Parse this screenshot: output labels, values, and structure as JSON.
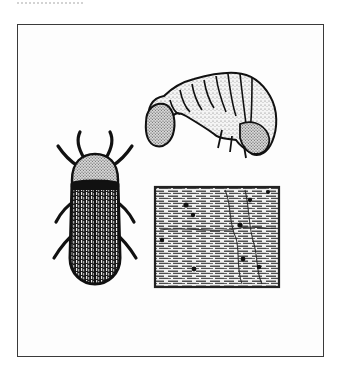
{
  "document": {
    "type": "scanned illustration plate",
    "top_text_clipped": true,
    "figure": {
      "frame": {
        "stroke": "#3a3a3a",
        "background": "#ffffff"
      },
      "panels": [
        {
          "name": "larva",
          "description": "Curved C-shaped beetle larva (grub) with segmented body, stippled shading"
        },
        {
          "name": "adult-beetle",
          "description": "Elongated dark beetle seen from above with ridged elytra and six legs"
        },
        {
          "name": "damaged-wood",
          "description": "Rectangular block of wood grain with small round exit holes"
        }
      ]
    }
  }
}
